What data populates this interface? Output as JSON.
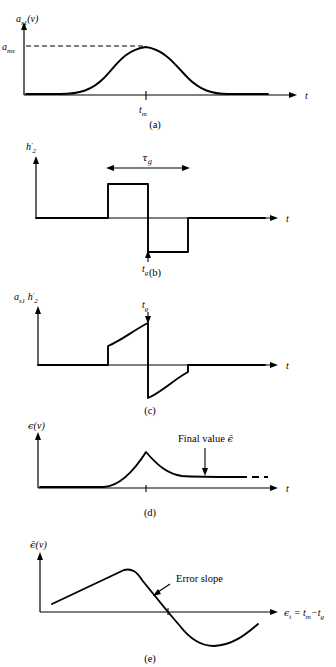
{
  "figure": {
    "background": "#ffffff",
    "ink": "#000000"
  },
  "panels": [
    {
      "id": "a",
      "caption": "(a)",
      "ylabel": "a",
      "ylabel_sub": "s1",
      "ylabel_arg": "(v)",
      "ymax_label": "a",
      "ymax_sub": "ms",
      "xlabel": "t",
      "tick_label": "t",
      "tick_sub": "m",
      "description": "Smooth bell-shaped received pulse envelope peaking at t_m"
    },
    {
      "id": "b",
      "caption": "(b)",
      "ylabel": "h",
      "ylabel_sub": "2",
      "ylabel_prime": "′",
      "xlabel": "t",
      "span_label": "τ",
      "span_sub": "g",
      "tick_label": "t",
      "tick_sub": "g",
      "description": "Bipolar split-gate reference: positive gate then negative gate, total width tau_g centred on t_g"
    },
    {
      "id": "c",
      "caption": "(c)",
      "ylabel_1": "a",
      "ylabel_1_sub": "s1",
      "ylabel_2": "h",
      "ylabel_2_sub": "2",
      "ylabel_2_prime": "′",
      "xlabel": "t",
      "tick_label": "t",
      "tick_sub": "g",
      "description": "Product of pulse envelope and split gate: positive lobe before t_g, negative lobe after t_g"
    },
    {
      "id": "d",
      "caption": "(d)",
      "ylabel": "ϵ",
      "ylabel_arg": "(v)",
      "xlabel": "t",
      "annotation": "Final value",
      "annotation_symbol": "ϵ̄",
      "description": "Integrated error signal rising to a peak then settling to a constant final value"
    },
    {
      "id": "e",
      "caption": "(e)",
      "ylabel": "ϵ̄",
      "ylabel_arg": "(v)",
      "xlabel_eps": "ϵ",
      "xlabel_eps_sub": "t",
      "xlabel_eq": "=",
      "xlabel_tm": "t",
      "xlabel_tm_sub": "m",
      "xlabel_minus": "−",
      "xlabel_tg": "t",
      "xlabel_tg_sub": "g",
      "annotation": "Error slope",
      "description": "S-curve discriminator characteristic with linear error slope through the origin"
    }
  ]
}
